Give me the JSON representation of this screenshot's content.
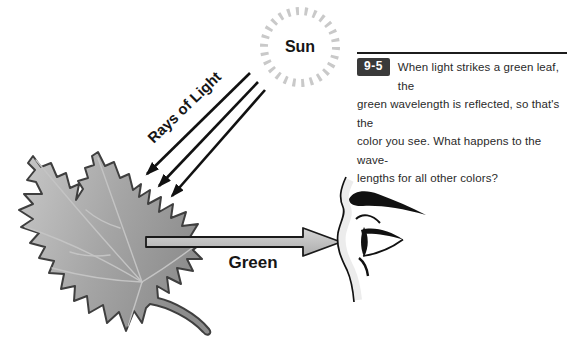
{
  "figure": {
    "labels": {
      "sun": "Sun",
      "rays_of_light": "Rays of Light",
      "green": "Green"
    },
    "caption": {
      "figure_number": "9-5",
      "lines": [
        "When light strikes a green leaf, the",
        "green wavelength is reflected, so that's the",
        "color you see. What happens to the wave-",
        "lengths for all other colors?"
      ]
    },
    "colors": {
      "badge_bg": "#3a3a3a",
      "badge_text": "#ffffff",
      "leaf_fill_light": "#c8c8c8",
      "leaf_fill_dark": "#8d8d8d",
      "leaf_outline": "#3f3f3f",
      "arrow_fill_light": "#d6d6d6",
      "arrow_fill_dark": "#acacac",
      "ink": "#111111",
      "sun_tick": "#c9c9c9"
    }
  }
}
